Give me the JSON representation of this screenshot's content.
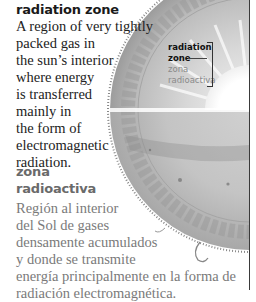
{
  "entry_en": {
    "term": "radiation zone",
    "definition_lines": [
      "A region of very tightly",
      "packed gas in",
      "the sun’s interior",
      "where energy",
      "is transferred",
      "mainly in",
      "the form of",
      "electromagnetic",
      "radiation."
    ]
  },
  "entry_es": {
    "term_lines": [
      "zona",
      "radioactiva"
    ],
    "definition_lines": [
      "Región al interior",
      "del Sol de gases",
      "densamente acumulados",
      "y donde se transmite",
      "energía principalmente en la forma de",
      "radiación electromagnética."
    ]
  },
  "illustration": {
    "subject": "sun cross-section",
    "label_en": [
      "radiation",
      "zone"
    ],
    "label_es": [
      "zona",
      "radioactiva"
    ]
  },
  "colors": {
    "text_en": "#222222",
    "text_es": "#7a7a7a",
    "sun_gray": "#b8b8b8",
    "core": "#ffffff"
  }
}
